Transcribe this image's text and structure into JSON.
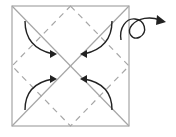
{
  "diagram": {
    "type": "origami-fold",
    "colors": {
      "background": "#ffffff",
      "crease": "#a6a6a6",
      "dashed": "#a6a6a6",
      "arrow": "#222222"
    },
    "square": {
      "x": 12,
      "y": 6,
      "w": 117,
      "h": 120
    },
    "steps": [
      "fold-corners-to-center",
      "turn-over"
    ]
  }
}
